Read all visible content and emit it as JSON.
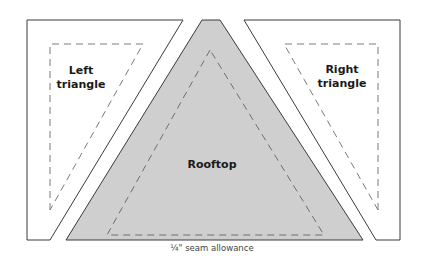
{
  "diagram": {
    "pieces": [
      {
        "id": "left",
        "label_line1": "Left",
        "label_line2": "triangle",
        "fill": "#ffffff"
      },
      {
        "id": "rooftop",
        "label": "Rooftop",
        "fill": "#cfcfcf"
      },
      {
        "id": "right",
        "label_line1": "Right",
        "label_line2": "triangle",
        "fill": "#ffffff"
      }
    ],
    "seam_allowance_label": "¼\" seam allowance",
    "colors": {
      "outline": "#3a3a3a",
      "dashed": "#7a7a7a",
      "rooftop_fill": "#cfcfcf"
    }
  }
}
